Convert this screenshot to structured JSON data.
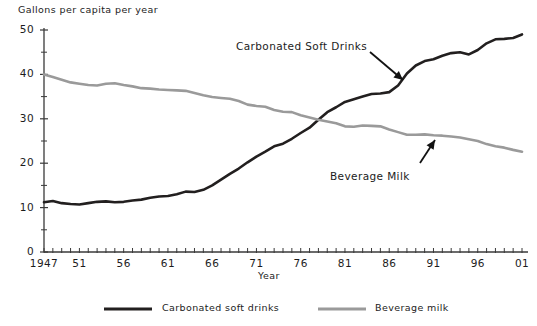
{
  "chart_data": {
    "type": "line",
    "title": "Gallons per capita per year",
    "xlabel": "Year",
    "ylabel": "Gallons per capita per year",
    "xlim": [
      1947,
      2001
    ],
    "ylim": [
      0,
      50
    ],
    "ytick_labels": [
      "0",
      "10",
      "20",
      "30",
      "40",
      "50"
    ],
    "ytick_values": [
      0,
      10,
      20,
      30,
      40,
      50
    ],
    "yminor_values": [
      5,
      15,
      25,
      35,
      45
    ],
    "xtick_labels": [
      "1947",
      "51",
      "56",
      "61",
      "66",
      "71",
      "76",
      "81",
      "86",
      "91",
      "96",
      "01"
    ],
    "xtick_values": [
      1947,
      1951,
      1956,
      1961,
      1966,
      1971,
      1976,
      1981,
      1986,
      1991,
      1996,
      2001
    ],
    "grid": false,
    "legend_position": "below-center",
    "x": [
      1947,
      1948,
      1949,
      1950,
      1951,
      1952,
      1953,
      1954,
      1955,
      1956,
      1957,
      1958,
      1959,
      1960,
      1961,
      1962,
      1963,
      1964,
      1965,
      1966,
      1967,
      1968,
      1969,
      1970,
      1971,
      1972,
      1973,
      1974,
      1975,
      1976,
      1977,
      1978,
      1979,
      1980,
      1981,
      1982,
      1983,
      1984,
      1985,
      1986,
      1987,
      1988,
      1989,
      1990,
      1991,
      1992,
      1993,
      1994,
      1995,
      1996,
      1997,
      1998,
      1999,
      2000,
      2001
    ],
    "series": [
      {
        "name": "Carbonated soft drinks",
        "color": "#221f1f",
        "values": [
          11.2,
          11.5,
          11.0,
          10.8,
          10.7,
          11.0,
          11.3,
          11.4,
          11.2,
          11.3,
          11.6,
          11.8,
          12.2,
          12.5,
          12.6,
          13.0,
          13.6,
          13.5,
          14.0,
          15.0,
          16.3,
          17.6,
          18.8,
          20.2,
          21.5,
          22.6,
          23.8,
          24.4,
          25.5,
          26.8,
          28.0,
          29.8,
          31.5,
          32.6,
          33.8,
          34.4,
          35.0,
          35.6,
          35.7,
          36.0,
          37.5,
          40.2,
          42.0,
          43.0,
          43.4,
          44.2,
          44.8,
          45.0,
          44.5,
          45.5,
          47.0,
          47.9,
          48.0,
          48.2,
          49.0
        ]
      },
      {
        "name": "Beverage milk",
        "color": "#9a9a9a",
        "values": [
          40.0,
          39.4,
          38.8,
          38.2,
          37.9,
          37.6,
          37.5,
          37.9,
          38.0,
          37.6,
          37.3,
          36.9,
          36.8,
          36.6,
          36.5,
          36.4,
          36.3,
          35.8,
          35.3,
          34.9,
          34.7,
          34.5,
          34.0,
          33.2,
          32.9,
          32.7,
          32.0,
          31.6,
          31.5,
          30.8,
          30.3,
          29.8,
          29.4,
          29.0,
          28.3,
          28.2,
          28.5,
          28.4,
          28.3,
          27.6,
          27.0,
          26.4,
          26.4,
          26.5,
          26.3,
          26.2,
          26.0,
          25.8,
          25.4,
          25.0,
          24.3,
          23.8,
          23.5,
          23.0,
          22.6
        ]
      }
    ],
    "annotations": [
      {
        "label": "Carbonated Soft Drinks",
        "series": "Carbonated soft drinks"
      },
      {
        "label": "Beverage Milk",
        "series": "Beverage milk"
      }
    ],
    "legend": [
      {
        "label": "Carbonated soft drinks",
        "color": "#221f1f"
      },
      {
        "label": "Beverage milk",
        "color": "#9a9a9a"
      }
    ]
  }
}
